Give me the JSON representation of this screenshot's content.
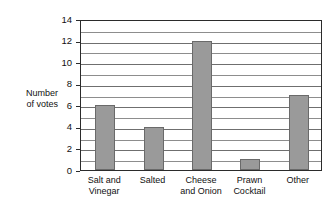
{
  "chart_data": {
    "type": "bar",
    "title": "",
    "subtitle": "",
    "xlabel": "",
    "ylabel": "Number\nof votes",
    "ylabel_lines": [
      "Number",
      "of votes"
    ],
    "categories": [
      "Salt and\nVinegar",
      "Salted",
      "Cheese\nand Onion",
      "Prawn\nCocktail",
      "Other"
    ],
    "category_lines": [
      [
        "Salt and",
        "Vinegar"
      ],
      [
        "Salted"
      ],
      [
        "Cheese",
        "and Onion"
      ],
      [
        "Prawn",
        "Cocktail"
      ],
      [
        "Other"
      ]
    ],
    "values": [
      6,
      4,
      12,
      1,
      7
    ],
    "ylim": [
      0,
      14
    ],
    "y_tick_labels": [
      "0",
      "2",
      "4",
      "6",
      "8",
      "10",
      "12",
      "14"
    ],
    "y_tick_values": [
      0,
      2,
      4,
      6,
      8,
      10,
      12,
      14
    ],
    "y_gridline_values": [
      1,
      2,
      3,
      4,
      5,
      6,
      7,
      8,
      9,
      10,
      11,
      12,
      13
    ],
    "y_major_gridline_values": [
      2,
      4,
      6,
      8,
      10,
      12
    ],
    "grid": true,
    "legend": false,
    "legend_position": "none",
    "bar_color": "#9a9a9a",
    "bar_border_color": "#6a6a6a",
    "axis_color": "#2b2b2b",
    "gridline_color": "#8d8d8d",
    "background_color": "#ffffff"
  },
  "labels": {
    "y_axis_title": "Number\nof votes",
    "y_ticks": [
      "0",
      "2",
      "4",
      "6",
      "8",
      "10",
      "12",
      "14"
    ],
    "x_categories": [
      "Salt and\nVinegar",
      "Salted",
      "Cheese\nand Onion",
      "Prawn\nCocktail",
      "Other"
    ]
  }
}
